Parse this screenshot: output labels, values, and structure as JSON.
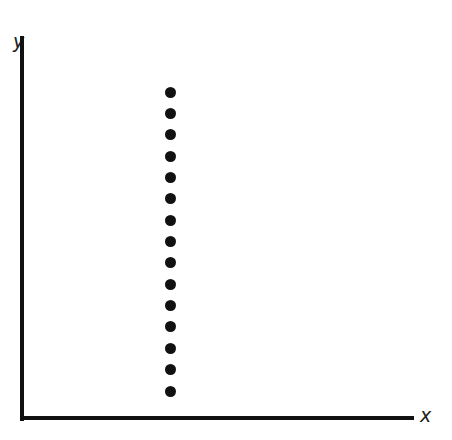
{
  "chart_data": {
    "type": "scatter",
    "title": "",
    "xlabel": "x",
    "ylabel": "y",
    "grid": false,
    "legend": null,
    "points": [
      {
        "x": 1,
        "y": 1
      },
      {
        "x": 1,
        "y": 2
      },
      {
        "x": 1,
        "y": 3
      },
      {
        "x": 1,
        "y": 4
      },
      {
        "x": 1,
        "y": 5
      },
      {
        "x": 1,
        "y": 6
      },
      {
        "x": 1,
        "y": 7
      },
      {
        "x": 1,
        "y": 8
      },
      {
        "x": 1,
        "y": 9
      },
      {
        "x": 1,
        "y": 10
      },
      {
        "x": 1,
        "y": 11
      },
      {
        "x": 1,
        "y": 12
      },
      {
        "x": 1,
        "y": 13
      },
      {
        "x": 1,
        "y": 14
      },
      {
        "x": 1,
        "y": 15
      }
    ]
  },
  "axes": {
    "x_label": "x",
    "y_label": "y"
  }
}
